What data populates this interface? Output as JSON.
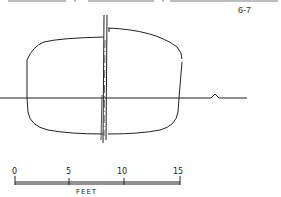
{
  "page": {
    "number": "6-7"
  },
  "drawing": {
    "subject": "hull-midship-section",
    "stroke_color": "#222222"
  },
  "scale": {
    "ticks": [
      "0",
      "5",
      "10",
      "15"
    ],
    "unit": "FEET"
  }
}
